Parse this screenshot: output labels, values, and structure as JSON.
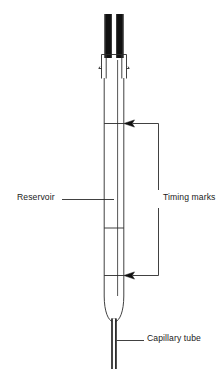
{
  "figure": {
    "name": "viscometer-diagram",
    "type": "technical-line-drawing",
    "background_color": "#ffffff",
    "stroke_color": "#2b2b2b",
    "fill_dark_color": "#111111",
    "labels": {
      "reservoir": "Reservoir",
      "timing_marks": "Timing marks",
      "capillary_tube": "Capillary tube"
    },
    "parts": {
      "upper_tube_left": "upper-tube-left",
      "upper_tube_right": "upper-tube-right",
      "collar": "collar",
      "body": "reservoir-body",
      "mark_upper": "timing-mark-upper",
      "mark_middle": "reservoir-divider",
      "mark_lower": "timing-mark-lower",
      "bulb": "bulb-bottom",
      "capillary": "capillary-tube"
    }
  }
}
